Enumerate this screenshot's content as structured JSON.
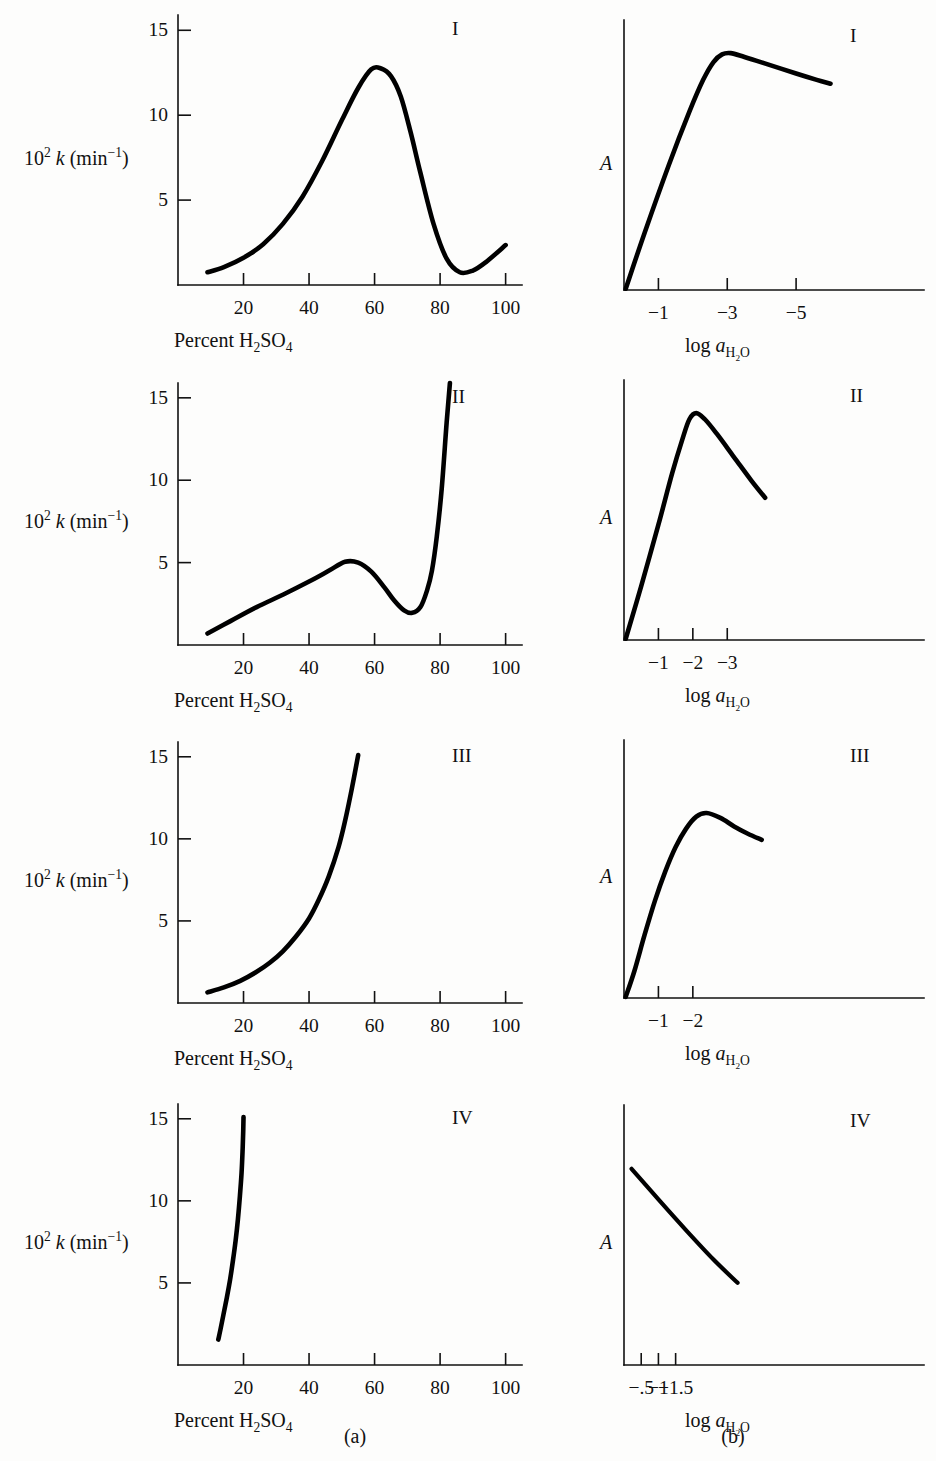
{
  "figure": {
    "width": 936,
    "height": 1461,
    "background": "#fdfdfc",
    "ink": "#000000",
    "column_captions": [
      {
        "label": "(a)",
        "x": 355,
        "y": 1426
      },
      {
        "label": "(b)",
        "x": 733,
        "y": 1426
      }
    ]
  },
  "labels": {
    "y_axis_left_html": "10<sup>2</sup> <span class=\"ital\">k</span> (min<sup>−1</sup>)",
    "y_axis_left_plain": "10^2 k (min^-1)",
    "x_axis_left_html": "Percent H<sub>2</sub>SO<sub>4</sub>",
    "x_axis_left_plain": "Percent H2SO4",
    "y_axis_right_plain": "A",
    "x_axis_right_html": "log <span class=\"ital\">a</span><sub>H<sub>2</sub>O</sub>",
    "x_axis_right_plain": "log a_H2O"
  },
  "chart_data": [
    {
      "id": "panel-a-I",
      "type": "line",
      "column": "a",
      "roman": "I",
      "title": "I",
      "xlabel": "Percent H2SO4",
      "ylabel": "10^2 k (min^-1)",
      "xlim": [
        0,
        105
      ],
      "ylim": [
        0,
        15.9
      ],
      "xticks": [
        20,
        40,
        60,
        80,
        100
      ],
      "xticklabels": [
        "20",
        "40",
        "60",
        "80",
        "100"
      ],
      "yticks": [
        5,
        10,
        15
      ],
      "yticklabels": [
        "5",
        "10",
        "15"
      ],
      "grid": false,
      "x": [
        9,
        14,
        20,
        26,
        32,
        38,
        44,
        50,
        55,
        59,
        62,
        65,
        68,
        71,
        74,
        78,
        82,
        86,
        90,
        94,
        100
      ],
      "y": [
        0.75,
        1.05,
        1.6,
        2.4,
        3.6,
        5.2,
        7.3,
        9.7,
        11.6,
        12.7,
        12.75,
        12.3,
        11.1,
        9.0,
        6.6,
        3.6,
        1.55,
        0.75,
        0.85,
        1.35,
        2.35
      ]
    },
    {
      "id": "panel-b-I",
      "type": "line",
      "column": "b",
      "roman": "I",
      "title": "I",
      "xlabel": "log a_H2O",
      "ylabel": "A",
      "xlim": [
        0,
        8.6
      ],
      "ylim": [
        0,
        10.6
      ],
      "xticks": [
        1,
        3,
        5
      ],
      "xticklabels": [
        "−1",
        "−3",
        "−5"
      ],
      "yticks": [],
      "yticklabels": [],
      "grid": false,
      "x": [
        0.05,
        0.6,
        1.3,
        1.9,
        2.3,
        2.6,
        2.85,
        3.1,
        3.5,
        4.2,
        5.0,
        5.6,
        6.0
      ],
      "y": [
        0.05,
        2.25,
        4.9,
        7.0,
        8.25,
        8.95,
        9.25,
        9.3,
        9.15,
        8.85,
        8.5,
        8.25,
        8.1
      ]
    },
    {
      "id": "panel-a-II",
      "type": "line",
      "column": "a",
      "roman": "II",
      "title": "II",
      "xlabel": "Percent H2SO4",
      "ylabel": "10^2 k (min^-1)",
      "xlim": [
        0,
        105
      ],
      "ylim": [
        0,
        15.9
      ],
      "xticks": [
        20,
        40,
        60,
        80,
        100
      ],
      "xticklabels": [
        "20",
        "40",
        "60",
        "80",
        "100"
      ],
      "yticks": [
        5,
        10,
        15
      ],
      "yticklabels": [
        "5",
        "10",
        "15"
      ],
      "grid": false,
      "x": [
        9,
        16,
        24,
        32,
        40,
        46,
        51,
        55,
        59,
        63,
        66,
        69,
        71.5,
        74,
        76,
        77.5,
        79,
        80.5,
        82,
        83
      ],
      "y": [
        0.7,
        1.45,
        2.3,
        3.05,
        3.85,
        4.5,
        5.05,
        5.0,
        4.45,
        3.5,
        2.7,
        2.1,
        1.95,
        2.3,
        3.3,
        4.5,
        6.6,
        9.5,
        13.5,
        15.9
      ]
    },
    {
      "id": "panel-b-II",
      "type": "line",
      "column": "b",
      "roman": "II",
      "title": "II",
      "xlabel": "log a_H2O",
      "ylabel": "A",
      "xlim": [
        0,
        8.6
      ],
      "ylim": [
        0,
        10.6
      ],
      "xticks": [
        1,
        2,
        3
      ],
      "xticklabels": [
        "−1",
        "−2",
        "−3"
      ],
      "yticks": [],
      "yticklabels": [],
      "grid": false,
      "x": [
        0.05,
        0.5,
        1.0,
        1.4,
        1.7,
        1.9,
        2.1,
        2.35,
        2.7,
        3.2,
        3.7,
        4.1
      ],
      "y": [
        0.05,
        2.2,
        4.7,
        6.8,
        8.2,
        9.0,
        9.25,
        9.0,
        8.4,
        7.45,
        6.5,
        5.8
      ]
    },
    {
      "id": "panel-a-III",
      "type": "line",
      "column": "a",
      "roman": "III",
      "title": "III",
      "xlabel": "Percent H2SO4",
      "ylabel": "10^2 k (min^-1)",
      "xlim": [
        0,
        105
      ],
      "ylim": [
        0,
        15.9
      ],
      "xticks": [
        20,
        40,
        60,
        80,
        100
      ],
      "xticklabels": [
        "20",
        "40",
        "60",
        "80",
        "100"
      ],
      "yticks": [
        5,
        10,
        15
      ],
      "yticklabels": [
        "5",
        "10",
        "15"
      ],
      "grid": false,
      "x": [
        9,
        14,
        19,
        24,
        28,
        32,
        36,
        40,
        43,
        46,
        49,
        51,
        53,
        55
      ],
      "y": [
        0.65,
        0.95,
        1.35,
        1.9,
        2.45,
        3.15,
        4.05,
        5.15,
        6.3,
        7.7,
        9.5,
        11.1,
        13.0,
        15.1
      ]
    },
    {
      "id": "panel-b-III",
      "type": "line",
      "column": "b",
      "roman": "III",
      "title": "III",
      "xlabel": "log a_H2O",
      "ylabel": "A",
      "xlim": [
        0,
        8.6
      ],
      "ylim": [
        0,
        10.6
      ],
      "xticks": [
        1,
        2
      ],
      "xticklabels": [
        "−1",
        "−2"
      ],
      "yticks": [],
      "yticklabels": [],
      "grid": false,
      "x": [
        0.05,
        0.3,
        0.6,
        0.9,
        1.2,
        1.5,
        1.8,
        2.1,
        2.4,
        2.8,
        3.2,
        3.6,
        4.0
      ],
      "y": [
        0.05,
        1.1,
        2.6,
        4.0,
        5.2,
        6.2,
        6.95,
        7.45,
        7.6,
        7.4,
        7.05,
        6.75,
        6.5
      ]
    },
    {
      "id": "panel-a-IV",
      "type": "line",
      "column": "a",
      "roman": "IV",
      "title": "IV",
      "xlabel": "Percent H2SO4",
      "ylabel": "10^2 k (min^-1)",
      "xlim": [
        0,
        105
      ],
      "ylim": [
        0,
        15.9
      ],
      "xticks": [
        20,
        40,
        60,
        80,
        100
      ],
      "xticklabels": [
        "20",
        "40",
        "60",
        "80",
        "100"
      ],
      "yticks": [
        5,
        10,
        15
      ],
      "yticklabels": [
        "5",
        "10",
        "15"
      ],
      "grid": false,
      "x": [
        12.3,
        13.0,
        13.9,
        14.9,
        15.9,
        16.8,
        17.6,
        18.3,
        18.9,
        19.4,
        19.7,
        19.9,
        20.0
      ],
      "y": [
        1.55,
        2.2,
        3.1,
        4.1,
        5.2,
        6.4,
        7.6,
        8.9,
        10.3,
        11.7,
        13.0,
        14.2,
        15.1
      ]
    },
    {
      "id": "panel-b-IV",
      "type": "line",
      "column": "b",
      "roman": "IV",
      "title": "IV",
      "xlabel": "log a_H2O",
      "ylabel": "A",
      "xlim": [
        0,
        8.6
      ],
      "ylim": [
        0,
        10.6
      ],
      "xticks": [
        0.5,
        1.0,
        1.5
      ],
      "xticklabels": [
        "−.5",
        "−1",
        "−1.5"
      ],
      "yticks": [],
      "yticklabels": [],
      "grid": false,
      "x": [
        0.22,
        1.0,
        1.8,
        2.6,
        3.3
      ],
      "y": [
        8.0,
        6.75,
        5.5,
        4.3,
        3.35
      ]
    }
  ],
  "panels": [
    {
      "id": "panel-a-I",
      "left": 0,
      "top": 0,
      "width": 560,
      "height": 350,
      "plot": {
        "x0": 178,
        "y0": 285,
        "x1": 522,
        "y1": 15
      },
      "column": "a"
    },
    {
      "id": "panel-b-I",
      "left": 560,
      "top": 0,
      "width": 376,
      "height": 350,
      "plot": {
        "x0": 64,
        "y0": 290,
        "x1": 360,
        "y1": 20
      },
      "column": "b"
    },
    {
      "id": "panel-a-II",
      "left": 0,
      "top": 350,
      "width": 560,
      "height": 360,
      "plot": {
        "x0": 178,
        "y0": 295,
        "x1": 522,
        "y1": 33
      },
      "column": "a"
    },
    {
      "id": "panel-b-II",
      "left": 560,
      "top": 350,
      "width": 376,
      "height": 360,
      "plot": {
        "x0": 64,
        "y0": 290,
        "x1": 360,
        "y1": 30
      },
      "column": "b"
    },
    {
      "id": "panel-a-III",
      "left": 0,
      "top": 710,
      "width": 560,
      "height": 350,
      "plot": {
        "x0": 178,
        "y0": 293,
        "x1": 522,
        "y1": 32
      },
      "column": "a"
    },
    {
      "id": "panel-b-III",
      "left": 560,
      "top": 710,
      "width": 376,
      "height": 350,
      "plot": {
        "x0": 64,
        "y0": 288,
        "x1": 360,
        "y1": 30
      },
      "column": "b"
    },
    {
      "id": "panel-a-IV",
      "left": 0,
      "top": 1060,
      "width": 560,
      "height": 401,
      "plot": {
        "x0": 178,
        "y0": 305,
        "x1": 522,
        "y1": 44
      },
      "column": "a"
    },
    {
      "id": "panel-b-IV",
      "left": 560,
      "top": 1060,
      "width": 376,
      "height": 401,
      "plot": {
        "x0": 64,
        "y0": 305,
        "x1": 360,
        "y1": 45
      },
      "column": "b"
    }
  ]
}
